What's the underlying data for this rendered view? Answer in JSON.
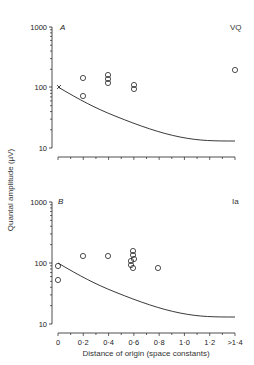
{
  "chart_data": [
    {
      "type": "scatter",
      "panel": "A",
      "corner_label": "VQ",
      "ylabel": "Quantal amplitude (µV)",
      "xlabel": "Distance of origin (space constants)",
      "yscale": "log",
      "ylim": [
        10,
        1000
      ],
      "yticks": [
        10,
        100,
        1000
      ],
      "xticks": [
        "0",
        "0.2",
        "0.4",
        "0.6",
        "0.8",
        "1.0",
        "1.2",
        ">1.4"
      ],
      "grid": false,
      "points": [
        {
          "x": 0,
          "y": 105,
          "marker": "cross"
        },
        {
          "x": 0.2,
          "y": 140
        },
        {
          "x": 0.2,
          "y": 70
        },
        {
          "x": 0.4,
          "y": 150
        },
        {
          "x": 0.4,
          "y": 130
        },
        {
          "x": 0.4,
          "y": 115
        },
        {
          "x": 0.6,
          "y": 105
        },
        {
          "x": 0.6,
          "y": 95
        },
        {
          "x": ">1.4",
          "y": 185
        }
      ],
      "curve": {
        "x": [
          0,
          0.2,
          0.4,
          0.6,
          0.8,
          1.0,
          1.2,
          1.4
        ],
        "y": [
          100,
          62,
          40,
          27,
          19,
          15.5,
          14,
          13.5
        ]
      }
    },
    {
      "type": "scatter",
      "panel": "B",
      "corner_label": "Ia",
      "ylabel": "Quantal amplitude (µV)",
      "xlabel": "Distance of origin (space constants)",
      "yscale": "log",
      "ylim": [
        10,
        1000
      ],
      "yticks": [
        10,
        100,
        1000
      ],
      "xticks": [
        "0",
        "0.2",
        "0.4",
        "0.6",
        "0.8",
        "1.0",
        "1.2",
        ">1.4"
      ],
      "grid": false,
      "points": [
        {
          "x": 0,
          "y": 92
        },
        {
          "x": 0,
          "y": 53
        },
        {
          "x": 0.2,
          "y": 130
        },
        {
          "x": 0.4,
          "y": 132
        },
        {
          "x": 0.6,
          "y": 160
        },
        {
          "x": 0.6,
          "y": 140
        },
        {
          "x": 0.6,
          "y": 115
        },
        {
          "x": 0.6,
          "y": 105
        },
        {
          "x": 0.6,
          "y": 90
        },
        {
          "x": 0.6,
          "y": 85
        },
        {
          "x": 0.8,
          "y": 82
        }
      ],
      "curve": {
        "x": [
          0,
          0.2,
          0.4,
          0.6,
          0.8,
          1.0,
          1.2,
          1.4
        ],
        "y": [
          100,
          60,
          38,
          26,
          19,
          15.5,
          14,
          13.5
        ]
      }
    }
  ],
  "labels": {
    "panel_a": "A",
    "panel_b": "B",
    "corner_a": "VQ",
    "corner_b": "Ia",
    "ylabel": "Quantal amplitude (µV)",
    "xlabel": "Distance of origin (space constants)",
    "ytick_1000": "1000",
    "ytick_100": "100",
    "ytick_10": "10",
    "xticks": [
      "0",
      "0·2",
      "0·4",
      "0·6",
      "0·8",
      "1·0",
      "1·2",
      ">1·4"
    ]
  }
}
